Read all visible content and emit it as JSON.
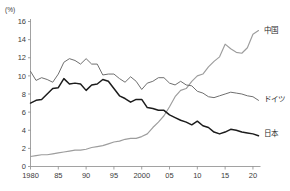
{
  "chart_data": {
    "type": "line",
    "title": "",
    "xlabel": "",
    "ylabel": "(%)",
    "ylim": [
      0,
      16
    ],
    "xlim": [
      1980,
      2021
    ],
    "grid": false,
    "legend_position": "right-inline",
    "yticks": [
      "0",
      "2",
      "4",
      "6",
      "8",
      "10",
      "12",
      "14",
      "16"
    ],
    "ytick_values": [
      0,
      2,
      4,
      6,
      8,
      10,
      12,
      14,
      16
    ],
    "xticks": [
      "1980",
      "85",
      "90",
      "95",
      "2000",
      "05",
      "10",
      "15",
      "20"
    ],
    "xtick_values": [
      1980,
      1985,
      1990,
      1995,
      2000,
      2005,
      2010,
      2015,
      2020
    ],
    "x": [
      1980,
      1981,
      1982,
      1983,
      1984,
      1985,
      1986,
      1987,
      1988,
      1989,
      1990,
      1991,
      1992,
      1993,
      1994,
      1995,
      1996,
      1997,
      1998,
      1999,
      2000,
      2001,
      2002,
      2003,
      2004,
      2005,
      2006,
      2007,
      2008,
      2009,
      2010,
      2011,
      2012,
      2013,
      2014,
      2015,
      2016,
      2017,
      2018,
      2019,
      2020,
      2021
    ],
    "series": [
      {
        "name": "中国",
        "name_en": "China",
        "color": "#9d9d9d",
        "label_x": 2021,
        "label_y": 15.0,
        "values": [
          1.1,
          1.2,
          1.3,
          1.3,
          1.4,
          1.5,
          1.6,
          1.7,
          1.8,
          1.8,
          1.9,
          2.1,
          2.2,
          2.3,
          2.5,
          2.7,
          2.8,
          3.0,
          3.1,
          3.1,
          3.3,
          3.6,
          4.3,
          4.9,
          5.6,
          6.6,
          7.7,
          8.4,
          8.6,
          9.4,
          10.0,
          10.2,
          11.0,
          11.6,
          12.1,
          13.5,
          13.0,
          12.6,
          12.5,
          13.1,
          14.6,
          15.0
        ]
      },
      {
        "name": "ドイツ",
        "name_en": "Germany",
        "color": "#6f6f6f",
        "label_x": 2021,
        "label_y": 7.4,
        "values": [
          10.5,
          9.5,
          9.8,
          9.6,
          9.3,
          10.2,
          11.5,
          11.9,
          11.7,
          11.3,
          11.9,
          11.3,
          11.3,
          10.1,
          10.2,
          10.2,
          9.7,
          9.3,
          9.9,
          9.4,
          8.5,
          9.2,
          9.4,
          9.8,
          9.8,
          9.2,
          9.0,
          9.4,
          9.0,
          8.9,
          8.3,
          8.1,
          7.7,
          7.6,
          7.8,
          8.0,
          8.2,
          8.1,
          8.0,
          7.8,
          7.7,
          7.3
        ]
      },
      {
        "name": "日本",
        "name_en": "Japan",
        "color": "#1c1c1c",
        "label_x": 2021,
        "label_y": 3.7,
        "values": [
          7.0,
          7.3,
          7.4,
          8.0,
          8.6,
          8.7,
          9.7,
          9.1,
          9.2,
          9.1,
          8.4,
          9.0,
          9.1,
          9.6,
          9.4,
          8.6,
          7.8,
          7.5,
          7.1,
          7.4,
          7.4,
          6.5,
          6.4,
          6.2,
          6.2,
          5.7,
          5.4,
          5.1,
          4.9,
          4.6,
          5.0,
          4.5,
          4.3,
          3.8,
          3.6,
          3.8,
          4.1,
          4.0,
          3.8,
          3.7,
          3.6,
          3.4
        ]
      }
    ]
  }
}
